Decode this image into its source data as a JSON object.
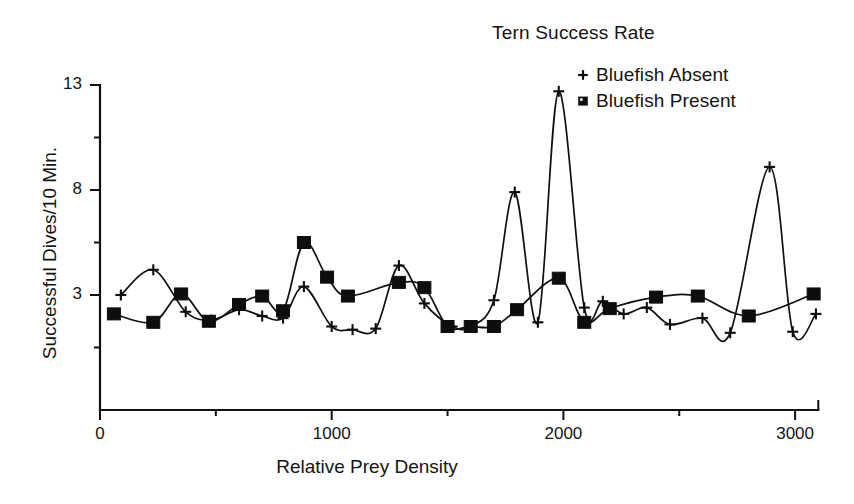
{
  "chart_data": {
    "type": "line",
    "title": "Tern Success Rate",
    "xlabel": "Relative Prey Density",
    "ylabel": "Successful Dives/10 Min.",
    "xlim": [
      0,
      3150
    ],
    "ylim": [
      0,
      13
    ],
    "grid": false,
    "legend_position": "top-right",
    "x_ticks_major": [
      0,
      1000,
      2000,
      3000
    ],
    "x_tick_labels": [
      "0",
      "1000",
      "2000",
      "3000"
    ],
    "x_ticks_minor": [
      500,
      1500,
      2500
    ],
    "y_ticks_major": [
      3,
      8,
      13
    ],
    "y_tick_labels": [
      "3",
      "8",
      "13"
    ],
    "y_ticks_minor": [
      0.5,
      5.5,
      10.5
    ],
    "series": [
      {
        "name": "Bluefish Absent",
        "marker": "plus",
        "points": [
          {
            "x": 90,
            "y": 3.0
          },
          {
            "x": 230,
            "y": 4.2
          },
          {
            "x": 370,
            "y": 2.2
          },
          {
            "x": 480,
            "y": 1.8
          },
          {
            "x": 600,
            "y": 2.3
          },
          {
            "x": 700,
            "y": 2.0
          },
          {
            "x": 790,
            "y": 1.9
          },
          {
            "x": 880,
            "y": 3.4
          },
          {
            "x": 1000,
            "y": 1.5
          },
          {
            "x": 1090,
            "y": 1.35
          },
          {
            "x": 1190,
            "y": 1.4
          },
          {
            "x": 1290,
            "y": 4.4
          },
          {
            "x": 1400,
            "y": 2.6
          },
          {
            "x": 1520,
            "y": 1.5
          },
          {
            "x": 1600,
            "y": 1.5
          },
          {
            "x": 1700,
            "y": 2.75
          },
          {
            "x": 1790,
            "y": 7.9
          },
          {
            "x": 1890,
            "y": 1.7
          },
          {
            "x": 1980,
            "y": 12.7
          },
          {
            "x": 2090,
            "y": 2.4
          },
          {
            "x": 2170,
            "y": 2.7
          },
          {
            "x": 2260,
            "y": 2.1
          },
          {
            "x": 2360,
            "y": 2.4
          },
          {
            "x": 2460,
            "y": 1.6
          },
          {
            "x": 2600,
            "y": 1.9
          },
          {
            "x": 2720,
            "y": 1.2
          },
          {
            "x": 2890,
            "y": 9.1
          },
          {
            "x": 2990,
            "y": 1.25
          },
          {
            "x": 3090,
            "y": 2.1
          }
        ]
      },
      {
        "name": "Bluefish Present",
        "marker": "square",
        "points": [
          {
            "x": 60,
            "y": 2.1
          },
          {
            "x": 230,
            "y": 1.7
          },
          {
            "x": 350,
            "y": 3.05
          },
          {
            "x": 470,
            "y": 1.75
          },
          {
            "x": 600,
            "y": 2.55
          },
          {
            "x": 700,
            "y": 2.95
          },
          {
            "x": 790,
            "y": 2.25
          },
          {
            "x": 880,
            "y": 5.5
          },
          {
            "x": 980,
            "y": 3.85
          },
          {
            "x": 1070,
            "y": 2.95
          },
          {
            "x": 1290,
            "y": 3.6
          },
          {
            "x": 1400,
            "y": 3.35
          },
          {
            "x": 1500,
            "y": 1.5
          },
          {
            "x": 1600,
            "y": 1.5
          },
          {
            "x": 1700,
            "y": 1.5
          },
          {
            "x": 1800,
            "y": 2.3
          },
          {
            "x": 1980,
            "y": 3.8
          },
          {
            "x": 2090,
            "y": 1.7
          },
          {
            "x": 2200,
            "y": 2.35
          },
          {
            "x": 2400,
            "y": 2.9
          },
          {
            "x": 2580,
            "y": 2.95
          },
          {
            "x": 2800,
            "y": 2.0
          },
          {
            "x": 3080,
            "y": 3.05
          }
        ]
      }
    ]
  },
  "legend": {
    "entries": [
      {
        "label": "Bluefish Absent",
        "marker": "plus-marker"
      },
      {
        "label": "Bluefish Present",
        "marker": "square-marker"
      }
    ]
  },
  "colors": {
    "ink": "#101010",
    "background": "#ffffff"
  }
}
